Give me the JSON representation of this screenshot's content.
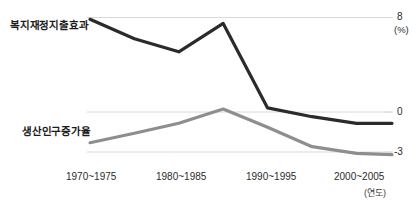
{
  "chart_data": {
    "type": "line",
    "title": "",
    "xlabel": "(연도)",
    "ylabel": "(%)",
    "categories": [
      "1970~1975",
      "1980~1985",
      "1990~1995",
      "2000~2005"
    ],
    "x_tick_labels": [
      "1970~1975",
      "1980~1985",
      "1990~1995",
      "2000~2005"
    ],
    "y_tick_labels": [
      "8",
      "0",
      "-3"
    ],
    "ylim": [
      -3.6,
      8.6
    ],
    "yticks": [
      8,
      0,
      -3
    ],
    "grid": true,
    "grid_lines": [
      8,
      0,
      -3
    ],
    "legend": "inline-labels",
    "legend_position": "left-inline",
    "series": [
      {
        "name": "복지재정지출효과",
        "color": "#2b2b2b",
        "x": [
          1972.5,
          1977.5,
          1982.5,
          1987.5,
          1992.5,
          1997.5,
          2002.5,
          2006.5
        ],
        "values": [
          7.85,
          6.2,
          5.1,
          7.5,
          0.35,
          -0.35,
          -0.85,
          -0.85
        ]
      },
      {
        "name": "생산인구증가율",
        "color": "#8e8e8e",
        "x": [
          1972.5,
          1977.5,
          1982.5,
          1987.5,
          1992.5,
          1997.5,
          2002.5,
          2006.5
        ],
        "values": [
          -2.3,
          -1.6,
          -0.85,
          0.25,
          -1.15,
          -2.6,
          -3.1,
          -3.2
        ]
      }
    ],
    "axis_unit_y": "(%)",
    "axis_unit_x": "(연도)"
  },
  "labels": {
    "welfare": "복지재정지출효과",
    "population": "생산인구증가율",
    "y_top": "8",
    "y_zero": "0",
    "y_bottom": "-3",
    "y_unit": "(%)",
    "x_unit": "(연도)",
    "x0": "1970~1975",
    "x1": "1980~1985",
    "x2": "1990~1995",
    "x3": "2000~2005"
  },
  "colors": {
    "series_dark": "#2b2b2b",
    "series_gray": "#8e8e8e",
    "grid": "#d8d8d8",
    "background": "#ffffff",
    "text": "#1c1c1c"
  }
}
